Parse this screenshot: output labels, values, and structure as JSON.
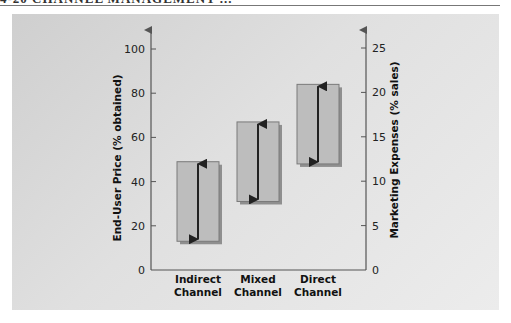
{
  "header": {
    "fragment": "4-20 CHANNEL MANAGEMENT ..."
  },
  "chart_data": {
    "type": "bar",
    "subtype": "floating-range",
    "title": "",
    "categories": [
      "Indirect Channel",
      "Mixed Channel",
      "Direct Channel"
    ],
    "category_lines": [
      [
        "Indirect",
        "Channel"
      ],
      [
        "Mixed",
        "Channel"
      ],
      [
        "Direct",
        "Channel"
      ]
    ],
    "series": [
      {
        "name": "End-User Price range (% obtained)",
        "axis": "left",
        "low": [
          13,
          31,
          48
        ],
        "high": [
          49,
          67,
          84
        ]
      },
      {
        "name": "Marketing Expenses range (% sales)",
        "axis": "right",
        "low": [
          3,
          8,
          12
        ],
        "high": [
          12,
          17,
          21
        ]
      }
    ],
    "ylabel": "End-User Price (% obtained)",
    "ylabel_right": "Marketing Expenses (% sales)",
    "ylim": [
      0,
      100
    ],
    "ylim_right": [
      0,
      25
    ],
    "yticks": [
      0,
      20,
      40,
      60,
      80,
      100
    ],
    "yticks_right": [
      0,
      5,
      10,
      15,
      20,
      25
    ],
    "grid": false,
    "legend": "none",
    "annotations": "Double-headed arrows inside each box indicate the range"
  },
  "colors": {
    "panel": "#dcdcdc",
    "box_fill": "#bdbdbd",
    "box_border": "#7a7a7a",
    "box_shadow": "#8f8f8f",
    "arrow": "#222222",
    "axis": "#555555"
  }
}
